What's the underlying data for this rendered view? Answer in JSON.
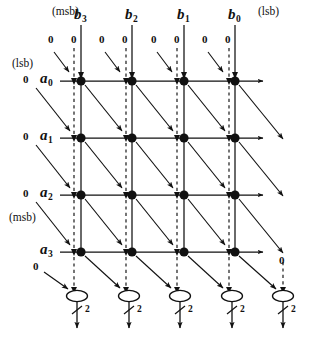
{
  "figure": {
    "type": "array-multiplier-dataflow-diagram",
    "title_top_left": "(msb)",
    "title_top_right": "(lsb)",
    "title_left_top": "(lsb)",
    "title_left_bottom": "(msb)",
    "colors": {
      "ink": "#111111",
      "background": "#ffffff",
      "node_fill": "#111111"
    }
  },
  "top_labels": {
    "msb_marker": "(msb)",
    "lsb_marker": "(lsb)",
    "operands": [
      {
        "name": "b3",
        "text": "b",
        "sub": "3"
      },
      {
        "name": "b2",
        "text": "b",
        "sub": "2"
      },
      {
        "name": "b1",
        "text": "b",
        "sub": "1"
      },
      {
        "name": "b0",
        "text": "b",
        "sub": "0"
      }
    ]
  },
  "left_labels": {
    "lsb_marker": "(lsb)",
    "msb_marker": "(msb)",
    "operands": [
      {
        "name": "a0",
        "text": "a",
        "sub": "0",
        "zero": "0"
      },
      {
        "name": "a1",
        "text": "a",
        "sub": "1",
        "zero": "0"
      },
      {
        "name": "a2",
        "text": "a",
        "sub": "2",
        "zero": "0"
      },
      {
        "name": "a3",
        "text": "a",
        "sub": "3",
        "zero": ""
      }
    ]
  },
  "top_zero_inputs": {
    "label": "0",
    "per_column": 2,
    "columns": 4,
    "values": [
      "0",
      "0",
      "0",
      "0",
      "0",
      "0",
      "0",
      "0"
    ]
  },
  "bottom_left_zero": {
    "label": "0"
  },
  "bottom_right_zero": {
    "label": "0"
  },
  "grid": {
    "rows": 4,
    "cols": 4,
    "node_count": 16,
    "row_y": [
      81,
      138,
      195,
      252
    ],
    "col_x": [
      81,
      132,
      184,
      235
    ]
  },
  "adders": {
    "count": 5,
    "x": [
      77,
      129,
      180,
      232,
      283
    ],
    "y": 295,
    "bus_label": "2",
    "bus_labels": [
      "2",
      "2",
      "2",
      "2",
      "2"
    ]
  }
}
